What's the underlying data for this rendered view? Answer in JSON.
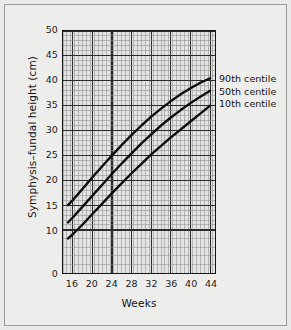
{
  "figure": {
    "background_color": "#ededeb",
    "border_color": "#9a9a97",
    "plot_background_color": "#e3e3e1",
    "axis_color": "#141414",
    "grid_major_color": "#2b2b2b",
    "grid_minor_color": "#8d8d8b",
    "curve_color": "#0d0d0d"
  },
  "chart_data": {
    "type": "line",
    "title": "",
    "xlabel": "Weeks",
    "ylabel": "Symphysis–fundal height (cm)",
    "xlim": [
      14,
      45
    ],
    "ylim": [
      0,
      50
    ],
    "xticks": [
      16,
      20,
      24,
      28,
      32,
      36,
      40,
      44
    ],
    "yticks": [
      0,
      10,
      15,
      20,
      25,
      30,
      35,
      40,
      45,
      50
    ],
    "ytick_labels": [
      "0",
      "10",
      "15",
      "20",
      "25",
      "30",
      "35",
      "40",
      "45",
      "50"
    ],
    "grid": true,
    "grid_minor": true,
    "legend_position": "right",
    "x": [
      15,
      16,
      18,
      20,
      22,
      24,
      26,
      28,
      30,
      32,
      34,
      36,
      38,
      40,
      42,
      44
    ],
    "series": [
      {
        "name": "90th centile",
        "values": [
          15.0,
          16.0,
          18.3,
          20.6,
          22.8,
          25.0,
          27.1,
          29.1,
          31.0,
          32.8,
          34.4,
          35.9,
          37.3,
          38.5,
          39.6,
          40.5
        ]
      },
      {
        "name": "50th centile",
        "values": [
          11.5,
          12.5,
          14.7,
          16.9,
          19.1,
          21.3,
          23.4,
          25.4,
          27.4,
          29.2,
          31.0,
          32.6,
          34.1,
          35.5,
          36.8,
          38.0
        ]
      },
      {
        "name": "10th centile",
        "values": [
          8.0,
          9.0,
          11.1,
          13.2,
          15.3,
          17.4,
          19.4,
          21.4,
          23.3,
          25.2,
          26.9,
          28.6,
          30.2,
          31.8,
          33.4,
          35.0
        ]
      }
    ]
  },
  "legend": {
    "entries": [
      {
        "label": "90th centile"
      },
      {
        "label": "50th centile"
      },
      {
        "label": "10th centile"
      }
    ]
  }
}
